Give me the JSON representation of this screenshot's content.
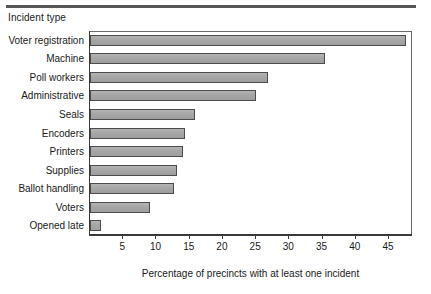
{
  "chart_data": {
    "type": "bar",
    "orientation": "horizontal",
    "title": "",
    "xlabel": "Percentage of precincts with at least one incident",
    "ylabel": "Incident type",
    "categories": [
      "Voter registration",
      "Machine",
      "Poll workers",
      "Administrative",
      "Seals",
      "Encoders",
      "Printers",
      "Supplies",
      "Ballot handling",
      "Voters",
      "Opened late"
    ],
    "values": [
      47.5,
      35.4,
      26.8,
      25.0,
      15.8,
      14.3,
      14.0,
      13.1,
      12.7,
      9.0,
      1.7
    ],
    "xlim": [
      0,
      48.6
    ],
    "xticks": [
      5,
      10,
      15,
      20,
      25,
      30,
      35,
      40,
      45
    ],
    "xtick_labels": [
      "5",
      "10",
      "15",
      "20",
      "25",
      "30",
      "35",
      "40",
      "45"
    ],
    "grid": false,
    "legend": null,
    "bar_color": "#a9a9a9",
    "bar_edge_color": "#4c4c4c",
    "axis_color": "#3a3a3a"
  },
  "figure": {
    "y_axis_heading": "Incident type",
    "x_axis_caption": "Percentage of precincts with at least one incident"
  }
}
